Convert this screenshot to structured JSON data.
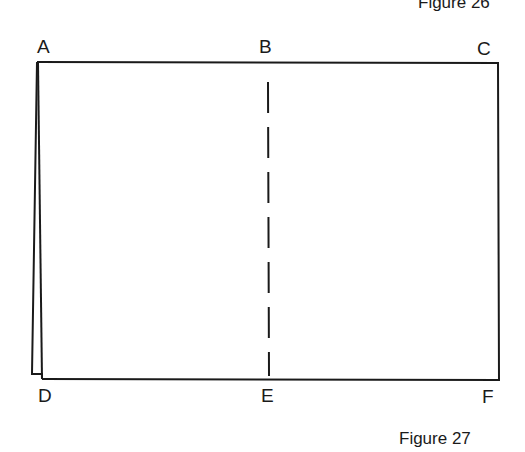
{
  "captions": {
    "top": "Figure 26",
    "bottom": "Figure 27"
  },
  "points": {
    "A": "A",
    "B": "B",
    "C": "C",
    "D": "D",
    "E": "E",
    "F": "F"
  },
  "colors": {
    "line": "#1a1a1a",
    "background": "#ffffff"
  }
}
